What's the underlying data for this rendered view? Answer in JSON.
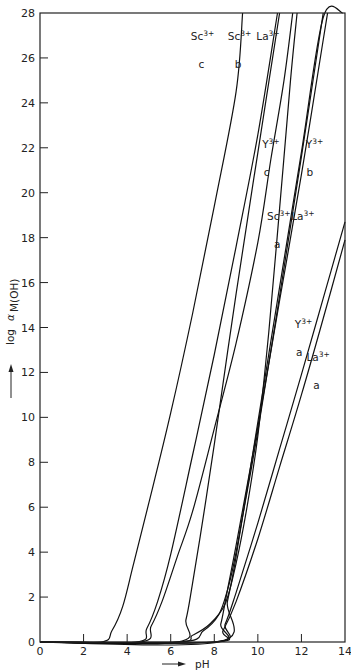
{
  "chart_data": {
    "type": "line",
    "title": "",
    "xlabel": "pH",
    "ylabel": "log α M(OH)",
    "xlim": [
      0,
      14
    ],
    "ylim": [
      0,
      28
    ],
    "xticks": [
      0,
      2,
      4,
      6,
      8,
      10,
      12,
      14
    ],
    "yticks": [
      0,
      2,
      4,
      6,
      8,
      10,
      12,
      14,
      16,
      18,
      20,
      22,
      24,
      26,
      28
    ],
    "grid": false,
    "series": [
      {
        "name": "Sc3+ c",
        "points": [
          [
            0,
            0
          ],
          [
            2.8,
            0
          ],
          [
            3.3,
            0.5
          ],
          [
            3.8,
            1.6
          ],
          [
            4.3,
            3.5
          ],
          [
            5.0,
            6.2
          ],
          [
            6.0,
            10.2
          ],
          [
            7.0,
            14.6
          ],
          [
            8.0,
            19.4
          ],
          [
            9.0,
            24.5
          ],
          [
            9.3,
            28
          ]
        ]
      },
      {
        "name": "Sc3+ b",
        "points": [
          [
            0,
            0
          ],
          [
            4.4,
            0
          ],
          [
            4.9,
            0.6
          ],
          [
            5.4,
            1.8
          ],
          [
            6.0,
            3.9
          ],
          [
            7.0,
            8.3
          ],
          [
            8.0,
            12.8
          ],
          [
            9.0,
            17.6
          ],
          [
            10.0,
            22.6
          ],
          [
            10.9,
            28
          ]
        ]
      },
      {
        "name": "Sc3+ a",
        "points": [
          [
            0,
            0
          ],
          [
            4.6,
            0
          ],
          [
            5.1,
            0.7
          ],
          [
            5.6,
            1.8
          ],
          [
            6.3,
            3.8
          ],
          [
            7.0,
            5.8
          ],
          [
            8.0,
            9.5
          ],
          [
            9.0,
            13.3
          ],
          [
            10.0,
            17.8
          ],
          [
            10.6,
            21.5
          ],
          [
            11.2,
            25
          ],
          [
            11.6,
            28
          ]
        ]
      },
      {
        "name": "La3+ c",
        "points": [
          [
            0,
            0
          ],
          [
            6.3,
            0
          ],
          [
            6.7,
            1.0
          ],
          [
            7.0,
            2.6
          ],
          [
            7.5,
            5.6
          ],
          [
            8.0,
            8.8
          ],
          [
            9.0,
            15.5
          ],
          [
            10.0,
            21.8
          ],
          [
            11.0,
            28
          ]
        ]
      },
      {
        "name": "Y3+ c",
        "points": [
          [
            0,
            0
          ],
          [
            6.2,
            0
          ],
          [
            7.0,
            0.3
          ],
          [
            7.8,
            0.8
          ],
          [
            8.5,
            1.7
          ],
          [
            9.0,
            3.5
          ],
          [
            9.5,
            6.0
          ],
          [
            10.0,
            9.2
          ],
          [
            10.5,
            13.8
          ],
          [
            11.0,
            19.3
          ],
          [
            11.5,
            25
          ],
          [
            11.8,
            28
          ]
        ]
      },
      {
        "name": "Y3+ b",
        "points": [
          [
            0,
            0
          ],
          [
            6.4,
            0
          ],
          [
            7.5,
            0.5
          ],
          [
            8.2,
            1.2
          ],
          [
            8.6,
            2.3
          ],
          [
            9.0,
            4.0
          ],
          [
            10.0,
            9.4
          ],
          [
            11.0,
            15.4
          ],
          [
            12.0,
            21.6
          ],
          [
            13.0,
            28
          ]
        ]
      },
      {
        "name": "La3+ b",
        "points": [
          [
            0,
            0
          ],
          [
            8.0,
            0
          ],
          [
            8.3,
            0.8
          ],
          [
            8.6,
            2.3
          ],
          [
            9.0,
            4.3
          ],
          [
            10.0,
            9.6
          ],
          [
            11.0,
            15.2
          ],
          [
            12.0,
            20.8
          ],
          [
            13.0,
            26.8
          ],
          [
            13.2,
            28
          ]
        ]
      },
      {
        "name": "La3+ a",
        "points": [
          [
            0,
            0
          ],
          [
            8.0,
            0
          ],
          [
            8.4,
            0.5
          ],
          [
            9.0,
            1.8
          ],
          [
            10.0,
            4.6
          ],
          [
            11.0,
            7.8
          ],
          [
            12.0,
            11.0
          ],
          [
            13.0,
            14.4
          ],
          [
            14.0,
            17.9
          ]
        ]
      },
      {
        "name": "Y3+ a",
        "points": [
          [
            0,
            0
          ],
          [
            8.0,
            0
          ],
          [
            8.5,
            0.8
          ],
          [
            9.0,
            2.2
          ],
          [
            10.0,
            5.3
          ],
          [
            11.0,
            8.6
          ],
          [
            12.0,
            11.9
          ],
          [
            13.0,
            15.3
          ],
          [
            14.0,
            18.7
          ]
        ]
      },
      {
        "name": "Sc3+/Y3+ b upper",
        "points": [
          [
            0,
            0
          ],
          [
            8.2,
            0
          ],
          [
            8.6,
            1.8
          ],
          [
            9.0,
            3.8
          ],
          [
            10.0,
            9.8
          ],
          [
            11.0,
            15.8
          ],
          [
            12.0,
            21.8
          ],
          [
            13.0,
            27.8
          ],
          [
            13.9,
            28
          ]
        ]
      }
    ],
    "annotations": [
      {
        "text": "Sc3+",
        "sub": "c",
        "at": [
          8.0,
          26.8
        ]
      },
      {
        "text": "Sc3+",
        "sub": "b",
        "at": [
          9.7,
          26.8
        ]
      },
      {
        "text": "La3+",
        "sub": "",
        "at": [
          11.0,
          26.8
        ]
      },
      {
        "text": "Y3+",
        "sub": "c",
        "at": [
          11.0,
          22.0
        ]
      },
      {
        "text": "Y3+",
        "sub": "b",
        "at": [
          13.0,
          22.0
        ]
      },
      {
        "text": "Sc3+",
        "sub": "a",
        "at": [
          11.5,
          18.8
        ]
      },
      {
        "text": "La3+",
        "sub": "",
        "at": [
          12.6,
          18.8
        ]
      },
      {
        "text": "Y3+",
        "sub": "a",
        "at": [
          12.5,
          14.0
        ]
      },
      {
        "text": "La3+",
        "sub": "a",
        "at": [
          13.3,
          12.5
        ]
      }
    ]
  },
  "labels": {
    "x_axis": "pH",
    "y_axis_log": "log",
    "y_axis_alpha": "α",
    "y_axis_sub": "M(OH)"
  }
}
